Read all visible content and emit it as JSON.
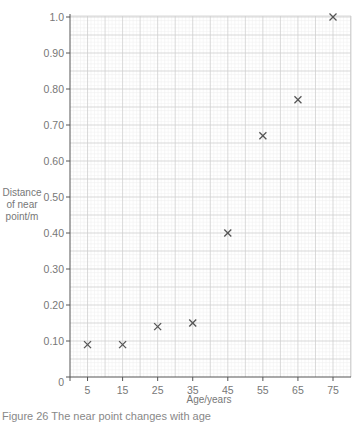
{
  "chart_data": {
    "type": "scatter",
    "title": "",
    "xlabel": "Age/years",
    "ylabel": "Distance of near point/m",
    "ylabel_lines": [
      "Distance",
      "of near",
      "point/m"
    ],
    "x": [
      5,
      15,
      25,
      35,
      45,
      55,
      65,
      75
    ],
    "series": [
      {
        "name": "near point",
        "marker": "x",
        "values": [
          0.09,
          0.09,
          0.14,
          0.15,
          0.4,
          0.67,
          0.77,
          1.0
        ]
      }
    ],
    "x_ticks": [
      "5",
      "15",
      "25",
      "35",
      "45",
      "55",
      "65",
      "75"
    ],
    "x_origin_label": "0",
    "y_ticks": [
      "0.10",
      "0.20",
      "0.30",
      "0.40",
      "0.50",
      "0.60",
      "0.70",
      "0.80",
      "0.90",
      "1.0"
    ],
    "xlim": [
      0,
      78
    ],
    "ylim": [
      0,
      1.0
    ],
    "grid": true,
    "legend": "none"
  },
  "caption": "Figure 26  The near point changes with age"
}
